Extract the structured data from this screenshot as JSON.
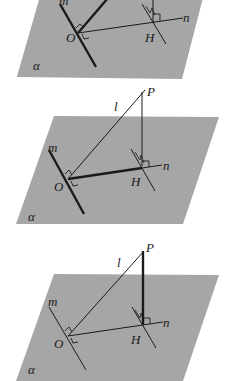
{
  "figure": {
    "colors": {
      "plane": "#a6a6a6",
      "line": "#1a1a1a",
      "background": "#ffffff"
    },
    "panels": [
      {
        "id": "top",
        "labels": {
          "plane": "α",
          "m": "m",
          "n": "n",
          "O": "O",
          "H": "H"
        },
        "emphasis": [
          "m",
          "l"
        ]
      },
      {
        "id": "middle",
        "labels": {
          "plane": "α",
          "m": "m",
          "n": "n",
          "O": "O",
          "H": "H",
          "P": "P",
          "l": "l"
        },
        "emphasis": [
          "m",
          "OH"
        ]
      },
      {
        "id": "bottom",
        "labels": {
          "plane": "α",
          "m": "m",
          "n": "n",
          "O": "O",
          "H": "H",
          "P": "P",
          "l": "l"
        },
        "emphasis": [
          "PH"
        ]
      }
    ]
  }
}
